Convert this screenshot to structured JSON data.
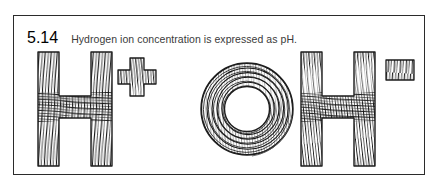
{
  "figure": {
    "caption_number": "5.14",
    "caption_text": "Hydrogen ion concentration is expressed as pH.",
    "border_color": "#2b2b2b",
    "background_color": "#ffffff",
    "ink_color": "#1c1c1c"
  },
  "artwork": {
    "description": "Hand-drawn contour-line lettering spelling the hydrogen ion and hydroxide ion",
    "style": "fingerprint / wood-grain contour hatching",
    "formula_plain": "H+ OH-",
    "glyphs": [
      {
        "name": "letter-h-first",
        "char": "H",
        "role": "hydrogen"
      },
      {
        "name": "superscript-plus",
        "char": "+",
        "role": "positive-charge"
      },
      {
        "name": "letter-o",
        "char": "O",
        "role": "oxygen"
      },
      {
        "name": "letter-h-second",
        "char": "H",
        "role": "hydrogen"
      },
      {
        "name": "superscript-minus",
        "char": "−",
        "role": "negative-charge"
      }
    ]
  }
}
